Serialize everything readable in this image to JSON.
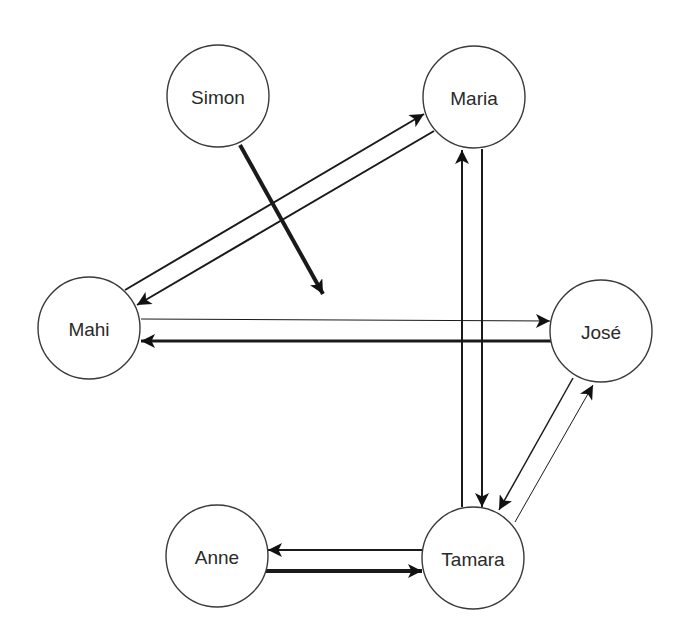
{
  "diagram": {
    "type": "directed-graph",
    "background": "#ffffff",
    "stroke_color": "#1a1a1a",
    "node_radius": 51,
    "nodes": [
      {
        "id": "simon",
        "label": "Simon",
        "cx": 218,
        "cy": 96
      },
      {
        "id": "maria",
        "label": "Maria",
        "cx": 474,
        "cy": 97
      },
      {
        "id": "mahi",
        "label": "Mahi",
        "cx": 89,
        "cy": 328
      },
      {
        "id": "jose",
        "label": "José",
        "cx": 601,
        "cy": 331
      },
      {
        "id": "anne",
        "label": "Anne",
        "cx": 217,
        "cy": 556
      },
      {
        "id": "tamara",
        "label": "Tamara",
        "cx": 473,
        "cy": 558
      }
    ],
    "edges": [
      {
        "id": "simon-to-none",
        "from": "Simon",
        "to": "",
        "x1": 240,
        "y1": 145,
        "x2": 323,
        "y2": 294,
        "weight": 4
      },
      {
        "id": "mahi-to-maria",
        "from": "Mahi",
        "to": "Maria",
        "x1": 125,
        "y1": 290,
        "x2": 424,
        "y2": 114,
        "weight": 2
      },
      {
        "id": "maria-to-mahi",
        "from": "Maria",
        "to": "Mahi",
        "x1": 434,
        "y1": 131,
        "x2": 137,
        "y2": 305,
        "weight": 2
      },
      {
        "id": "mahi-to-jose",
        "from": "Mahi",
        "to": "José",
        "x1": 141,
        "y1": 319,
        "x2": 550,
        "y2": 321,
        "weight": 1
      },
      {
        "id": "jose-to-mahi",
        "from": "José",
        "to": "Mahi",
        "x1": 551,
        "y1": 341,
        "x2": 141,
        "y2": 341,
        "weight": 3
      },
      {
        "id": "tamara-to-maria",
        "from": "Tamara",
        "to": "Maria",
        "x1": 462,
        "y1": 507,
        "x2": 462,
        "y2": 150,
        "weight": 2
      },
      {
        "id": "maria-to-tamara",
        "from": "Maria",
        "to": "Tamara",
        "x1": 482,
        "y1": 149,
        "x2": 482,
        "y2": 507,
        "weight": 2
      },
      {
        "id": "jose-to-tamara",
        "from": "José",
        "to": "Tamara",
        "x1": 573,
        "y1": 378,
        "x2": 499,
        "y2": 510,
        "weight": 1.5
      },
      {
        "id": "tamara-to-jose",
        "from": "Tamara",
        "to": "José",
        "x1": 515,
        "y1": 522,
        "x2": 593,
        "y2": 385,
        "weight": 1
      },
      {
        "id": "tamara-to-anne",
        "from": "Tamara",
        "to": "Anne",
        "x1": 423,
        "y1": 550,
        "x2": 268,
        "y2": 550,
        "weight": 2
      },
      {
        "id": "anne-to-tamara",
        "from": "Anne",
        "to": "Tamara",
        "x1": 266,
        "y1": 571,
        "x2": 422,
        "y2": 571,
        "weight": 4
      }
    ]
  }
}
